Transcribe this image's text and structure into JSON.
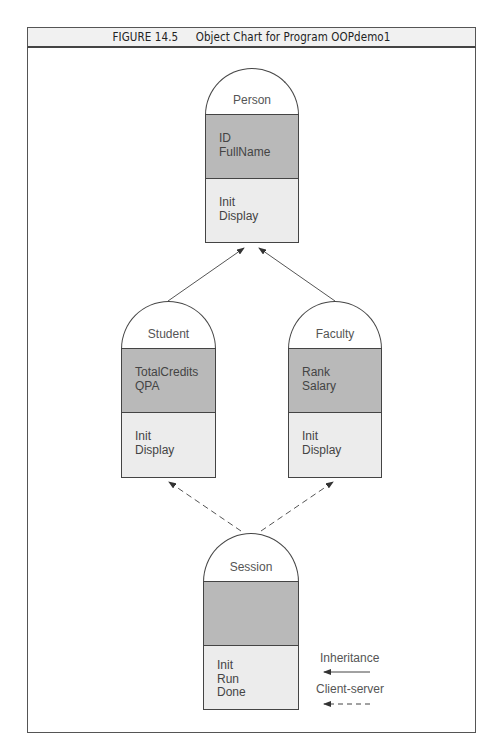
{
  "figure": {
    "number": "FIGURE 14.5",
    "title": "Object Chart for Program OOPdemo1"
  },
  "objects": [
    {
      "name": "Person",
      "attributes": [
        "ID",
        "FullName"
      ],
      "methods": [
        "Init",
        "Display"
      ]
    },
    {
      "name": "Student",
      "attributes": [
        "TotalCredits",
        "QPA"
      ],
      "methods": [
        "Init",
        "Display"
      ]
    },
    {
      "name": "Faculty",
      "attributes": [
        "Rank",
        "Salary"
      ],
      "methods": [
        "Init",
        "Display"
      ]
    },
    {
      "name": "Session",
      "attributes": [],
      "methods": [
        "Init",
        "Run",
        "Done"
      ]
    }
  ],
  "relationships": [
    {
      "from": "Student",
      "to": "Person",
      "type": "inheritance"
    },
    {
      "from": "Faculty",
      "to": "Person",
      "type": "inheritance"
    },
    {
      "from": "Session",
      "to": "Student",
      "type": "client-server"
    },
    {
      "from": "Session",
      "to": "Faculty",
      "type": "client-server"
    }
  ],
  "legend": {
    "inheritance": "Inheritance",
    "client_server": "Client-server"
  },
  "colors": {
    "dome": "#ffffff",
    "attributes": "#b9b9b9",
    "methods": "#ececec",
    "header": "#f1f1f1",
    "stroke": "#444444"
  }
}
